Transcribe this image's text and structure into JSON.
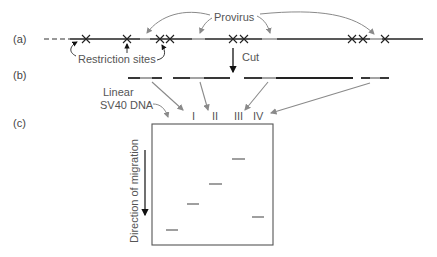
{
  "panels": {
    "a": "(a)",
    "b": "(b)",
    "c": "(c)"
  },
  "labels": {
    "provirus": "Provirus",
    "restriction_sites": "Restriction sites",
    "cut": "Cut",
    "linear_sv40_line1": "Linear",
    "linear_sv40_line2": "SV40 DNA",
    "direction": "Direction of migration"
  },
  "lanes": [
    "I",
    "II",
    "III",
    "IV"
  ],
  "colors": {
    "dna": "#222222",
    "provirus_segment": "#9a9a9a",
    "arrow_gray": "#8a8a8a",
    "text_gray": "#666666"
  }
}
